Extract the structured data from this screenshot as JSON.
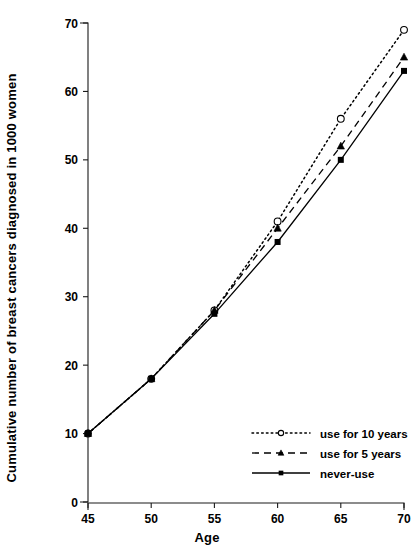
{
  "chart_data": {
    "type": "line",
    "title": "",
    "xlabel": "Age",
    "ylabel": "Cumulative number of breast cancers diagnosed in 1000 women",
    "x": [
      45,
      50,
      55,
      60,
      65,
      70
    ],
    "xticks": [
      "45",
      "50",
      "55",
      "60",
      "65",
      "70"
    ],
    "yticks": [
      "0",
      "10",
      "20",
      "30",
      "40",
      "50",
      "60",
      "70"
    ],
    "xlim": [
      45,
      70
    ],
    "ylim": [
      0,
      70
    ],
    "grid": false,
    "legend_position": "bottom-right",
    "series": [
      {
        "name": "use for 10 years",
        "marker": "open-circle",
        "linestyle": "dotted",
        "color": "#000000",
        "values": [
          10,
          18,
          28,
          41,
          56,
          69
        ]
      },
      {
        "name": "use for 5 years",
        "marker": "filled-triangle",
        "linestyle": "dashed",
        "color": "#000000",
        "values": [
          10,
          18,
          28,
          40,
          52,
          65
        ]
      },
      {
        "name": "never-use",
        "marker": "filled-square",
        "linestyle": "solid",
        "color": "#000000",
        "values": [
          10,
          18,
          27.5,
          38,
          50,
          63
        ]
      }
    ]
  },
  "legend": {
    "items": [
      {
        "label": "use for 10 years"
      },
      {
        "label": "use for 5 years"
      },
      {
        "label": "never-use"
      }
    ]
  },
  "axes": {
    "x_title": "Age",
    "y_title": "Cumulative number of breast cancers diagnosed in 1000 women"
  }
}
